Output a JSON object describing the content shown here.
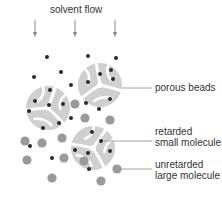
{
  "title": "solvent flow",
  "labels": {
    "porous_beads": "porous beads",
    "retarded_line1": "retarded",
    "retarded_line2": "small molecule",
    "unretarded_line1": "unretarded",
    "unretarded_line2": "large molecule"
  },
  "colors": {
    "bead": "#cfcfcf",
    "small_molecule": "#2a2a2a",
    "large_molecule": "#9a9a9a",
    "arrow": "#8a8a8a",
    "leader_line": "#888888",
    "text": "#333333"
  },
  "arrows_x": [
    35,
    75,
    115
  ],
  "beads": [
    {
      "cx": 48,
      "cy": 108,
      "r": 22,
      "rot": 20
    },
    {
      "cx": 100,
      "cy": 85,
      "r": 22,
      "rot": -10
    },
    {
      "cx": 93,
      "cy": 148,
      "r": 22,
      "rot": 35
    }
  ],
  "small_molecules": [
    [
      47,
      57
    ],
    [
      88,
      56
    ],
    [
      116,
      58
    ],
    [
      34,
      77
    ],
    [
      61,
      72
    ],
    [
      71,
      85
    ],
    [
      100,
      74
    ],
    [
      111,
      70
    ],
    [
      113,
      79
    ],
    [
      88,
      82
    ],
    [
      50,
      90
    ],
    [
      35,
      101
    ],
    [
      49,
      105
    ],
    [
      63,
      104
    ],
    [
      29,
      111
    ],
    [
      86,
      103
    ],
    [
      110,
      99
    ],
    [
      99,
      109
    ],
    [
      71,
      118
    ],
    [
      59,
      123
    ],
    [
      43,
      128
    ],
    [
      92,
      132
    ],
    [
      101,
      141
    ],
    [
      30,
      146
    ],
    [
      75,
      150
    ],
    [
      88,
      153
    ],
    [
      110,
      151
    ],
    [
      52,
      158
    ],
    [
      89,
      169
    ]
  ],
  "large_molecules": [
    [
      75,
      104
    ],
    [
      85,
      118
    ],
    [
      110,
      120
    ],
    [
      25,
      141
    ],
    [
      42,
      143
    ],
    [
      62,
      138
    ],
    [
      84,
      161
    ],
    [
      27,
      160
    ],
    [
      64,
      158
    ],
    [
      52,
      178
    ],
    [
      117,
      169
    ],
    [
      101,
      181
    ]
  ]
}
